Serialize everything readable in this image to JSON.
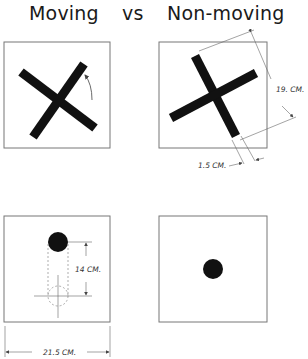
{
  "titles": {
    "moving": "Moving",
    "vs": "vs",
    "non_moving": "Non-moving"
  },
  "panels": {
    "moving_cross": {
      "shape": "cross",
      "rotation_indicator": "curved-arrow"
    },
    "non_moving_cross": {
      "shape": "cross",
      "dimensions": {
        "arm_length": "19. CM.",
        "arm_width": "1.5 CM."
      }
    },
    "moving_dot": {
      "shape": "dot",
      "dimensions": {
        "travel": "14 CM.",
        "square_width": "21.5 CM."
      }
    },
    "non_moving_dot": {
      "shape": "dot"
    }
  },
  "colors": {
    "ink": "#111111",
    "line": "#555555",
    "background": "#ffffff"
  }
}
